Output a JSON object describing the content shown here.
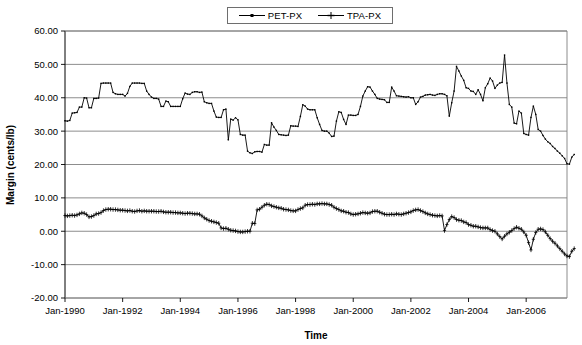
{
  "chart_data": {
    "type": "line",
    "title": "",
    "xlabel": "Time",
    "ylabel": "Margin (cents/lb)",
    "ylim": [
      -20,
      60
    ],
    "ytick_labels": [
      "60.00",
      "50.00",
      "40.00",
      "30.00",
      "20.00",
      "10.00",
      "0.00",
      "-10.00",
      "-20.00"
    ],
    "ytick_values": [
      60,
      50,
      40,
      30,
      20,
      10,
      0,
      -10,
      -20
    ],
    "xtick_labels": [
      "Jan-1990",
      "Jan-1992",
      "Jan-1994",
      "Jan-1996",
      "Jan-1998",
      "Jan-2000",
      "Jan-2002",
      "Jan-2004",
      "Jan-2006"
    ],
    "xtick_indices": [
      0,
      24,
      48,
      72,
      96,
      120,
      144,
      168,
      192
    ],
    "x_start": "Jan-1990",
    "x_end": "Jun-2007",
    "x_interval": "monthly",
    "n_points": 210,
    "grid": "horizontal",
    "legend_position": "top-center",
    "series": [
      {
        "name": "PET-PX",
        "marker": "small-dot",
        "color": "#000000",
        "values": [
          33.1,
          33.0,
          33.2,
          35.4,
          35.5,
          35.6,
          37.2,
          37.2,
          40.0,
          39.9,
          37.0,
          37.0,
          39.8,
          39.8,
          39.9,
          44.3,
          44.4,
          44.4,
          44.4,
          44.4,
          41.6,
          41.2,
          41.0,
          41.0,
          41.0,
          40.5,
          41.3,
          43.4,
          44.4,
          44.4,
          44.4,
          44.4,
          44.3,
          44.3,
          42.0,
          41.0,
          40.2,
          39.8,
          39.8,
          39.6,
          37.4,
          37.4,
          39.0,
          38.8,
          37.4,
          37.4,
          37.4,
          37.4,
          37.4,
          39.7,
          41.4,
          41.1,
          41.0,
          41.6,
          41.8,
          41.8,
          41.6,
          41.7,
          38.8,
          38.5,
          38.3,
          38.3,
          36.0,
          34.2,
          34.1,
          34.1,
          36.4,
          36.6,
          27.4,
          33.6,
          33.3,
          34.0,
          33.4,
          29.0,
          28.8,
          28.8,
          24.0,
          23.5,
          23.3,
          23.8,
          23.9,
          23.9,
          23.7,
          26.0,
          25.8,
          25.8,
          32.5,
          31.2,
          30.2,
          29.0,
          28.9,
          28.8,
          28.7,
          28.8,
          31.6,
          31.5,
          31.5,
          31.4,
          34.4,
          37.9,
          37.5,
          36.6,
          36.4,
          36.4,
          36.4,
          34.0,
          32.0,
          30.2,
          30.0,
          30.0,
          29.4,
          28.4,
          28.5,
          33.0,
          35.8,
          35.6,
          33.5,
          32.0,
          34.8,
          34.8,
          34.7,
          34.7,
          35.0,
          37.4,
          40.5,
          42.0,
          43.3,
          43.2,
          42.0,
          41.0,
          39.8,
          39.6,
          39.5,
          39.4,
          38.6,
          38.6,
          43.2,
          42.0,
          40.6,
          40.5,
          40.4,
          40.3,
          40.2,
          40.3,
          40.0,
          40.0,
          38.0,
          38.8,
          40.2,
          40.4,
          40.8,
          40.9,
          41.0,
          40.8,
          40.7,
          41.0,
          41.2,
          41.2,
          41.0,
          40.6,
          34.5,
          38.5,
          42.0,
          49.4,
          48.0,
          46.5,
          45.2,
          43.0,
          42.8,
          42.0,
          41.9,
          41.0,
          42.4,
          41.0,
          39.1,
          43.0,
          44.2,
          45.9,
          45.0,
          42.8,
          43.8,
          44.4,
          44.6,
          52.8,
          44.4,
          38.0,
          37.2,
          32.4,
          32.2,
          36.0,
          35.4,
          29.3,
          29.0,
          28.8,
          34.1,
          37.5,
          35.0,
          30.5,
          30.0,
          28.7,
          27.6,
          26.8,
          26.3,
          25.4,
          24.8,
          24.0,
          23.4,
          22.6,
          21.8,
          20.2,
          20.1,
          22.2,
          23.0
        ]
      },
      {
        "name": "TPA-PX",
        "marker": "plus",
        "color": "#000000",
        "values": [
          4.7,
          4.6,
          4.7,
          4.8,
          4.7,
          4.9,
          5.2,
          5.5,
          5.4,
          5.0,
          4.3,
          4.4,
          4.7,
          5.2,
          5.3,
          5.6,
          6.2,
          6.5,
          6.6,
          6.6,
          6.5,
          6.5,
          6.4,
          6.3,
          6.3,
          6.2,
          6.1,
          6.2,
          6.0,
          5.9,
          6.1,
          6.2,
          6.0,
          6.1,
          6.0,
          6.0,
          6.0,
          6.0,
          5.9,
          5.9,
          6.0,
          5.8,
          5.7,
          5.7,
          5.7,
          5.6,
          5.6,
          5.5,
          5.5,
          5.4,
          5.3,
          5.4,
          5.4,
          5.3,
          5.2,
          5.2,
          5.1,
          4.6,
          4.0,
          3.6,
          3.2,
          3.0,
          2.8,
          2.6,
          2.4,
          1.0,
          0.8,
          0.9,
          0.6,
          0.3,
          0.2,
          0.1,
          -0.1,
          -0.2,
          -0.2,
          -0.1,
          0.0,
          0.0,
          2.4,
          2.3,
          6.4,
          6.6,
          7.2,
          7.8,
          8.1,
          8.0,
          7.6,
          7.4,
          7.2,
          7.0,
          6.9,
          6.6,
          6.5,
          6.4,
          6.2,
          6.1,
          6.1,
          6.5,
          6.8,
          7.0,
          7.8,
          8.0,
          8.0,
          8.1,
          8.0,
          8.2,
          8.2,
          8.3,
          8.2,
          8.2,
          8.0,
          7.8,
          7.2,
          6.8,
          6.5,
          6.1,
          6.0,
          5.7,
          5.6,
          5.2,
          5.0,
          5.1,
          5.2,
          5.4,
          5.6,
          5.5,
          5.4,
          5.5,
          5.9,
          6.0,
          6.0,
          5.7,
          5.4,
          5.1,
          5.0,
          5.0,
          5.1,
          5.0,
          5.2,
          5.1,
          5.0,
          5.2,
          5.4,
          5.6,
          5.8,
          6.2,
          6.4,
          6.5,
          6.2,
          5.9,
          5.5,
          5.2,
          5.0,
          4.8,
          4.7,
          4.6,
          4.7,
          4.6,
          0.2,
          2.0,
          3.5,
          4.4,
          4.1,
          3.5,
          3.3,
          3.2,
          2.8,
          2.6,
          2.0,
          1.8,
          1.5,
          1.5,
          1.3,
          1.1,
          1.0,
          1.0,
          1.0,
          0.5,
          0.2,
          0.0,
          -0.8,
          -1.6,
          -2.3,
          -1.5,
          -0.8,
          -0.3,
          0.2,
          0.8,
          1.2,
          0.9,
          0.6,
          -0.2,
          -1.2,
          -3.4,
          -5.6,
          -2.4,
          -0.4,
          0.6,
          0.7,
          0.5,
          -0.2,
          -1.2,
          -2.2,
          -3.0,
          -3.6,
          -4.4,
          -5.2,
          -6.0,
          -6.8,
          -7.4,
          -7.6,
          -6.0,
          -5.2
        ]
      }
    ]
  },
  "legend": {
    "items": [
      {
        "label": "PET-PX"
      },
      {
        "label": "TPA-PX"
      }
    ]
  },
  "axes": {
    "y_title": "Margin (cents/lb)",
    "x_title": "Time"
  }
}
